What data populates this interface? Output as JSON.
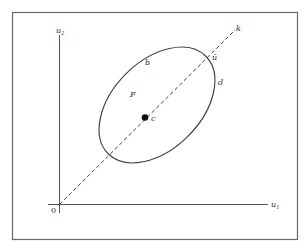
{
  "diagram": {
    "type": "geometric-plot",
    "axes": {
      "x_label": "u",
      "x_label_sub": "1",
      "y_label": "u",
      "y_label_sub": "2",
      "origin_label": "0"
    },
    "line": {
      "label": "k",
      "style": "dashed",
      "description": "ray from origin through point c"
    },
    "ellipse": {
      "label": "F",
      "boundary_labels": [
        "b",
        "d"
      ]
    },
    "points": [
      {
        "label": "c",
        "description": "filled center point on the dashed ray"
      },
      {
        "label": "ū",
        "description": "intersection of dashed ray with ellipse boundary"
      }
    ],
    "colors": {
      "stroke": "#444444",
      "frame": "#666666",
      "background": "#ffffff"
    }
  }
}
